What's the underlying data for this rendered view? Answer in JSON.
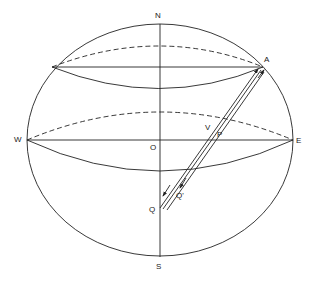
{
  "diagram": {
    "labels": {
      "north": "N",
      "south": "S",
      "west": "W",
      "east": "E",
      "origin": "O",
      "point_a": "A",
      "point_q": "Q",
      "point_q_prime": "Q'",
      "vector_v": "V",
      "vector_p": "P"
    },
    "colors": {
      "stroke": "#222222",
      "background": "#ffffff"
    }
  }
}
